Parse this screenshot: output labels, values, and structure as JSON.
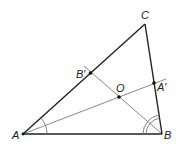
{
  "diagram": {
    "colors": {
      "side": "#222222",
      "bisector": "#888888",
      "point": "#111111",
      "arc": "#777777"
    },
    "vertices": {
      "A": {
        "label": "A"
      },
      "B": {
        "label": "B"
      },
      "C": {
        "label": "C"
      }
    },
    "points": {
      "A_prime": {
        "label": "A′",
        "on": "BC",
        "description": "foot of bisector from A"
      },
      "B_prime": {
        "label": "B′",
        "on": "AC",
        "description": "foot of bisector from B"
      },
      "O": {
        "label": "O",
        "description": "intersection of bisectors"
      }
    },
    "segments": [
      {
        "name": "AB",
        "type": "side"
      },
      {
        "name": "BC",
        "type": "side"
      },
      {
        "name": "CA",
        "type": "side"
      },
      {
        "name": "AA'",
        "type": "angle-bisector"
      },
      {
        "name": "BB'",
        "type": "angle-bisector"
      }
    ],
    "angle_marks": [
      {
        "vertex": "A",
        "arcs": 1,
        "note": "equal halves of angle A"
      },
      {
        "vertex": "B",
        "arcs": 2,
        "note": "equal halves of angle B"
      }
    ]
  }
}
